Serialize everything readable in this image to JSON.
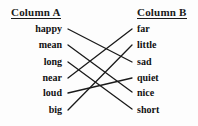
{
  "worksheet": {
    "title_left": "Column A",
    "title_right": "Column B",
    "column_a": [
      {
        "label": "happy",
        "x": 62,
        "y": 31
      },
      {
        "label": "mean",
        "x": 62,
        "y": 47
      },
      {
        "label": "long",
        "x": 62,
        "y": 64
      },
      {
        "label": "near",
        "x": 62,
        "y": 80
      },
      {
        "label": "loud",
        "x": 62,
        "y": 95
      },
      {
        "label": "big",
        "x": 62,
        "y": 112
      }
    ],
    "column_b": [
      {
        "label": "far",
        "x": 137,
        "y": 31
      },
      {
        "label": "little",
        "x": 137,
        "y": 47
      },
      {
        "label": "sad",
        "x": 137,
        "y": 64
      },
      {
        "label": "quiet",
        "x": 137,
        "y": 80
      },
      {
        "label": "nice",
        "x": 137,
        "y": 95
      },
      {
        "label": "short",
        "x": 137,
        "y": 112
      }
    ],
    "connections": [
      {
        "from": "happy",
        "to": "sad",
        "x1": 68,
        "y1": 29,
        "x2": 132,
        "y2": 62
      },
      {
        "from": "mean",
        "to": "nice",
        "x1": 68,
        "y1": 45,
        "x2": 132,
        "y2": 92
      },
      {
        "from": "long",
        "to": "short",
        "x1": 68,
        "y1": 62,
        "x2": 132,
        "y2": 109
      },
      {
        "from": "near",
        "to": "far",
        "x1": 68,
        "y1": 78,
        "x2": 132,
        "y2": 29
      },
      {
        "from": "loud",
        "to": "quiet",
        "x1": 68,
        "y1": 93,
        "x2": 132,
        "y2": 78
      },
      {
        "from": "big",
        "to": "little",
        "x1": 68,
        "y1": 110,
        "x2": 132,
        "y2": 45
      }
    ],
    "line_color": "#1a1a1a",
    "text_color": "#111111",
    "background": "#fdfdfd"
  }
}
